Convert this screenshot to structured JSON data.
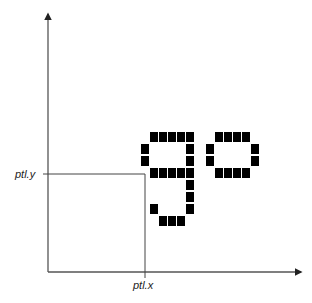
{
  "diagram": {
    "labels": {
      "point_y": "ptl.y",
      "point_x": "ptl.x"
    },
    "colors": {
      "axis": "#555555",
      "guide": "#444444",
      "pixel": "#000000",
      "background": "#ffffff"
    },
    "glyphs": [
      {
        "char": "g",
        "bitmap": [
          "011111",
          "100001",
          "100001",
          "011111",
          "000001",
          "000001",
          "010001",
          "001110"
        ]
      },
      {
        "char": "o",
        "bitmap": [
          "011110",
          "100001",
          "100001",
          "011110"
        ]
      }
    ]
  }
}
